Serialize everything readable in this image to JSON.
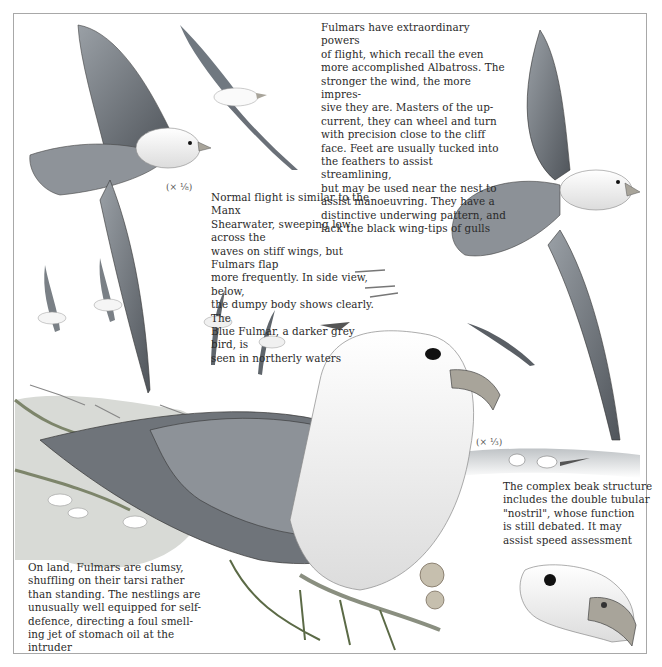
{
  "plate": {
    "subject": "Fulmar",
    "captions": {
      "flight": "Fulmars have extraordinary powers\nof flight, which recall the even\nmore accomplished Albatross. The\nstronger the wind, the more impres-\nsive they are. Masters of the up-\ncurrent, they can wheel and turn\nwith precision close to the cliff\nface. Feet are usually tucked into\nthe feathers to assist streamlining,\nbut may be used near the nest to\nassist manoeuvring. They have a\ndistinctive underwing pattern, and\nlack the black wing-tips of gulls",
      "normal_flight": "Normal flight is similar to the Manx\nShearwater, sweeping low across the\nwaves on stiff wings, but Fulmars flap\nmore frequently. In side view, below,\nthe dumpy body shows clearly. The\nBlue Fulmar, a darker grey bird, is\nseen in northerly waters",
      "on_land": "On land, Fulmars are clumsy,\nshuffling on their tarsi rather\nthan standing. The nestlings are\nunusually well equipped for self-\ndefence, directing a foul smell-\ning jet of stomach oil at the intruder",
      "beak": "The complex beak structure\nincludes the double tubular\n\"nostril\", whose function\nis still debated. It may\nassist speed assessment"
    },
    "scales": {
      "large_flight_bird": "(× ⅛)",
      "beak_detail": "(× ⅓)"
    },
    "colors": {
      "frame": "#a8a8a8",
      "text": "#2a2a2a",
      "wing_grey": "#7d8288",
      "dark_grey": "#3c3f43",
      "beak": "#a8a49a",
      "grass": "#5b6a46"
    }
  }
}
